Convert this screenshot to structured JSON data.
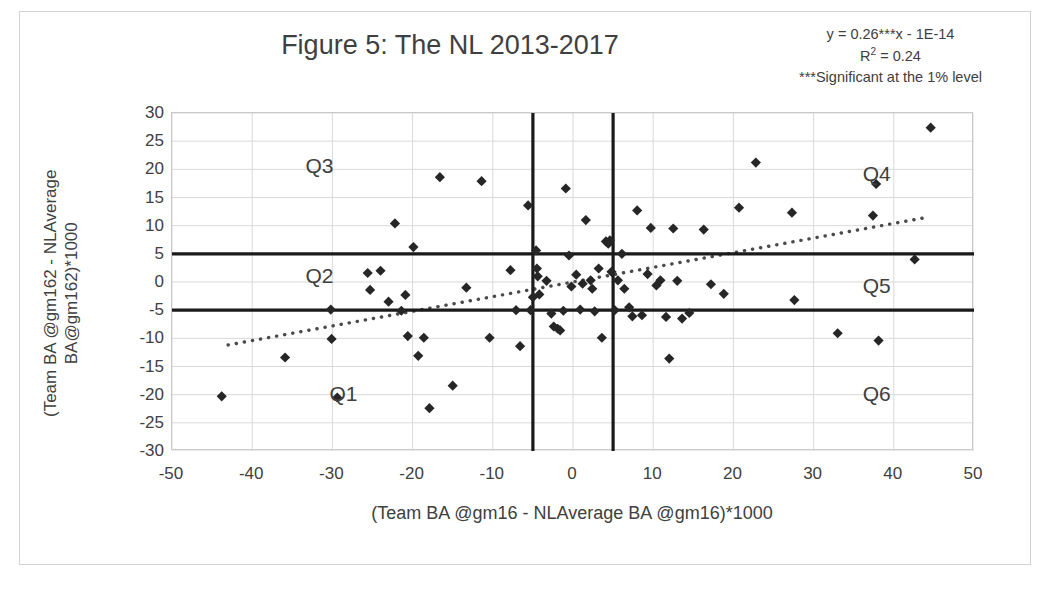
{
  "figure": {
    "title": "Figure 5: The NL 2013-2017",
    "border_color": "#d2d2d2"
  },
  "annotation": {
    "equation": "y = 0.26***x - 1E-14",
    "r_squared_prefix": "R",
    "r_squared_sup": "2",
    "r_squared_value": " = 0.24",
    "significance_note": "***Significant at the 1% level"
  },
  "axes": {
    "x_title": "(Team BA @gm16 - NLAverage BA @gm16)*1000",
    "y_title_line1": "(Team BA @gm162 - NLAverage",
    "y_title_line2": "BA@gm162)*1000",
    "x_ticks": [
      "-50",
      "-40",
      "-30",
      "-20",
      "-10",
      "0",
      "10",
      "20",
      "30",
      "40",
      "50"
    ],
    "y_ticks": [
      "30",
      "25",
      "20",
      "15",
      "10",
      "5",
      "0",
      "-5",
      "-10",
      "-15",
      "-20",
      "-25",
      "-30"
    ]
  },
  "quadrants": [
    {
      "name": "Q3",
      "label": "Q3",
      "x": -31,
      "y": 20.5
    },
    {
      "name": "Q2",
      "label": "Q2",
      "x": -31,
      "y": 0.8
    },
    {
      "name": "Q1",
      "label": "Q1",
      "x": -28,
      "y": -20.0
    },
    {
      "name": "Q4",
      "label": "Q4",
      "x": 38.5,
      "y": 19.0
    },
    {
      "name": "Q5",
      "label": "Q5",
      "x": 38.5,
      "y": -0.8
    },
    {
      "name": "Q6",
      "label": "Q6",
      "x": 38.5,
      "y": -20.0
    }
  ],
  "chart_data": {
    "type": "scatter",
    "title": "Figure 5: The NL 2013-2017",
    "xlabel": "(Team BA @gm16 - NLAverage BA @gm16)*1000",
    "ylabel": "(Team BA @gm162 - NLAverage BA@gm162)*1000",
    "xlim": [
      -50,
      50
    ],
    "ylim": [
      -30,
      30
    ],
    "x_tick_step": 10,
    "y_tick_step": 5,
    "grid": true,
    "legend": "none",
    "marker": "diamond",
    "marker_color": "#262626",
    "regression": {
      "equation": "y = 0.26***x - 1E-14",
      "slope": 0.26,
      "intercept": -1e-14,
      "r_squared": 0.24,
      "style": "dotted",
      "color": "#4a4a4a",
      "x_start": -43,
      "x_end": 44
    },
    "reference_lines": {
      "color": "#1a1a1a",
      "horizontal": [
        5,
        -5
      ],
      "vertical": [
        -5,
        5
      ]
    },
    "points": [
      [
        -43.8,
        -20.3
      ],
      [
        -35.9,
        -13.4
      ],
      [
        -30.2,
        -4.9
      ],
      [
        -30.1,
        -10.1
      ],
      [
        -29.4,
        -20.5
      ],
      [
        -25.6,
        1.6
      ],
      [
        -25.3,
        -1.4
      ],
      [
        -24.0,
        2.0
      ],
      [
        -23.0,
        -3.5
      ],
      [
        -22.2,
        10.4
      ],
      [
        -21.4,
        -5.1
      ],
      [
        -20.9,
        -2.3
      ],
      [
        -20.6,
        -9.6
      ],
      [
        -19.9,
        6.2
      ],
      [
        -19.3,
        -13.1
      ],
      [
        -18.6,
        -9.9
      ],
      [
        -17.9,
        -22.4
      ],
      [
        -16.6,
        18.6
      ],
      [
        -15.0,
        -18.4
      ],
      [
        -13.3,
        -1.0
      ],
      [
        -11.4,
        17.9
      ],
      [
        -10.4,
        -9.9
      ],
      [
        -7.8,
        2.1
      ],
      [
        -7.1,
        -5.0
      ],
      [
        -6.6,
        -11.4
      ],
      [
        -5.6,
        13.6
      ],
      [
        -5.3,
        -5.0
      ],
      [
        -5.0,
        -2.7
      ],
      [
        -4.6,
        5.6
      ],
      [
        -4.5,
        2.4
      ],
      [
        -4.4,
        1.0
      ],
      [
        -4.2,
        -2.2
      ],
      [
        -3.3,
        0.2
      ],
      [
        -2.7,
        -5.6
      ],
      [
        -2.4,
        -7.9
      ],
      [
        -1.9,
        -8.3
      ],
      [
        -1.6,
        -8.6
      ],
      [
        -1.2,
        -5.1
      ],
      [
        -0.9,
        16.6
      ],
      [
        -0.5,
        4.7
      ],
      [
        -0.2,
        -0.8
      ],
      [
        0.4,
        1.3
      ],
      [
        0.9,
        -4.9
      ],
      [
        1.2,
        -0.3
      ],
      [
        1.6,
        11.0
      ],
      [
        2.2,
        0.3
      ],
      [
        2.4,
        -1.2
      ],
      [
        2.7,
        -5.2
      ],
      [
        3.2,
        2.4
      ],
      [
        3.6,
        -9.9
      ],
      [
        4.1,
        7.2
      ],
      [
        4.4,
        6.8
      ],
      [
        4.6,
        7.4
      ],
      [
        4.8,
        1.8
      ],
      [
        5.2,
        -5.0
      ],
      [
        5.6,
        0.3
      ],
      [
        6.1,
        5.0
      ],
      [
        6.4,
        -1.2
      ],
      [
        7.0,
        -4.5
      ],
      [
        7.4,
        -6.1
      ],
      [
        8.0,
        12.7
      ],
      [
        8.6,
        -5.9
      ],
      [
        9.3,
        1.4
      ],
      [
        9.7,
        9.6
      ],
      [
        10.4,
        -0.6
      ],
      [
        10.9,
        0.3
      ],
      [
        11.6,
        -6.2
      ],
      [
        12.0,
        -13.6
      ],
      [
        12.5,
        9.5
      ],
      [
        13.0,
        0.2
      ],
      [
        13.6,
        -6.5
      ],
      [
        14.5,
        -5.5
      ],
      [
        16.3,
        9.3
      ],
      [
        17.2,
        -0.4
      ],
      [
        18.8,
        -2.1
      ],
      [
        20.7,
        13.2
      ],
      [
        22.8,
        21.2
      ],
      [
        27.3,
        12.3
      ],
      [
        27.6,
        -3.2
      ],
      [
        33.0,
        -9.1
      ],
      [
        37.4,
        11.8
      ],
      [
        37.8,
        17.4
      ],
      [
        38.1,
        -10.4
      ],
      [
        42.6,
        4.0
      ],
      [
        44.6,
        27.4
      ]
    ]
  }
}
